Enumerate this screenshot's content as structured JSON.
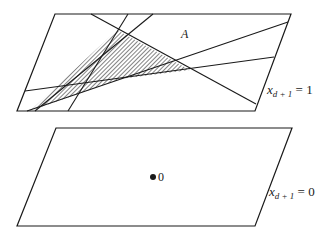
{
  "figure": {
    "upper_plane": {
      "label_var": "x",
      "label_sub": "d + 1",
      "label_eq": " = 1",
      "corners": [
        [
          55,
          14
        ],
        [
          291,
          14
        ],
        [
          255,
          111
        ],
        [
          17,
          111
        ]
      ]
    },
    "lower_plane": {
      "label_var": "x",
      "label_sub": "d + 1",
      "label_eq": " = 0",
      "corners": [
        [
          56,
          128
        ],
        [
          292,
          128
        ],
        [
          255,
          226
        ],
        [
          17,
          226
        ]
      ]
    },
    "region_label": "A",
    "origin_label": "0",
    "origin_point": [
      153,
      177
    ],
    "lines": [
      {
        "name": "line-1",
        "from": [
          91,
          14
        ],
        "to": [
          256,
          104
        ]
      },
      {
        "name": "line-2",
        "from": [
          128,
          14
        ],
        "to": [
          68,
          111
        ]
      },
      {
        "name": "line-3",
        "from": [
          153,
          14
        ],
        "to": [
          35,
          111
        ]
      },
      {
        "name": "line-4",
        "from": [
          288,
          22
        ],
        "to": [
          27,
          111
        ]
      },
      {
        "name": "line-5",
        "from": [
          274,
          57
        ],
        "to": [
          25,
          91
        ]
      }
    ],
    "hatched_region": [
      [
        117,
        30
      ],
      [
        190,
        70
      ],
      [
        120,
        79
      ],
      [
        30,
        111
      ]
    ],
    "colors": {
      "stroke": "#1a1a1a",
      "background": "#ffffff"
    }
  }
}
